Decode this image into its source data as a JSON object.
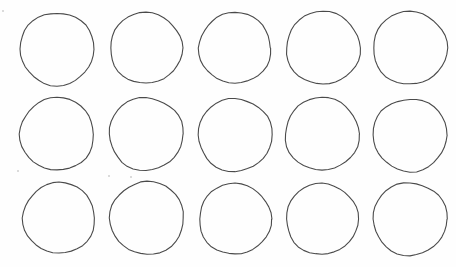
{
  "sheet": {
    "width": 456,
    "height": 267,
    "background": "#fefefe",
    "stroke_color": "#4a4a4a",
    "stroke_width": 1.1,
    "grid": {
      "rows": 3,
      "cols": 5
    },
    "circles": [
      {
        "row": 1,
        "col": 1,
        "cx": 57,
        "cy": 49,
        "r": 37
      },
      {
        "row": 1,
        "col": 2,
        "cx": 146,
        "cy": 48,
        "r": 36
      },
      {
        "row": 1,
        "col": 3,
        "cx": 235,
        "cy": 48,
        "r": 36
      },
      {
        "row": 1,
        "col": 4,
        "cx": 323,
        "cy": 48,
        "r": 37
      },
      {
        "row": 1,
        "col": 5,
        "cx": 410,
        "cy": 48,
        "r": 37
      },
      {
        "row": 2,
        "col": 1,
        "cx": 57,
        "cy": 134,
        "r": 37
      },
      {
        "row": 2,
        "col": 2,
        "cx": 146,
        "cy": 134,
        "r": 37
      },
      {
        "row": 2,
        "col": 3,
        "cx": 235,
        "cy": 135,
        "r": 37
      },
      {
        "row": 2,
        "col": 4,
        "cx": 322,
        "cy": 134,
        "r": 37
      },
      {
        "row": 2,
        "col": 5,
        "cx": 410,
        "cy": 135,
        "r": 37
      },
      {
        "row": 3,
        "col": 1,
        "cx": 59,
        "cy": 218,
        "r": 36
      },
      {
        "row": 3,
        "col": 2,
        "cx": 147,
        "cy": 218,
        "r": 37
      },
      {
        "row": 3,
        "col": 3,
        "cx": 235,
        "cy": 219,
        "r": 36
      },
      {
        "row": 3,
        "col": 4,
        "cx": 322,
        "cy": 219,
        "r": 36
      },
      {
        "row": 3,
        "col": 5,
        "cx": 410,
        "cy": 219,
        "r": 37
      }
    ],
    "specks": [
      {
        "x": 2,
        "y": 10
      },
      {
        "x": 17,
        "y": 170
      },
      {
        "x": 108,
        "y": 175
      },
      {
        "x": 130,
        "y": 176
      }
    ]
  }
}
